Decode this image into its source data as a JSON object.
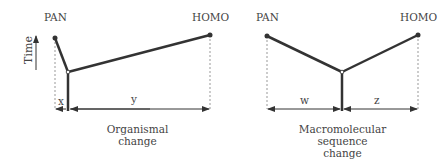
{
  "left_panel": {
    "taxa": {
      "pan": "PAN",
      "homo": "HOMO"
    },
    "axis_label": "Time",
    "distance_labels": {
      "x": "x",
      "y": "y"
    },
    "caption_line1": "Organismal",
    "caption_line2": "change"
  },
  "right_panel": {
    "taxa": {
      "pan": "PAN",
      "homo": "HOMO"
    },
    "distance_labels": {
      "w": "w",
      "z": "z"
    },
    "caption_line1": "Macromolecular",
    "caption_line2": "sequence",
    "caption_line3": "change"
  },
  "colors": {
    "branch": "#333333",
    "guide": "#999999",
    "text": "#444444"
  }
}
